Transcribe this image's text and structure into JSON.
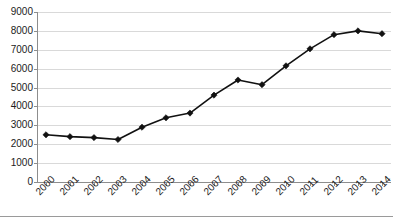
{
  "chart_data": {
    "type": "line",
    "title": "",
    "subtitle": "",
    "xlabel": "",
    "ylabel": "",
    "categories": [
      "2000",
      "2001",
      "2002",
      "2003",
      "2004",
      "2005",
      "2006",
      "2007",
      "2008",
      "2009",
      "2010",
      "2011",
      "2012",
      "2013",
      "2014"
    ],
    "values": [
      2500,
      2400,
      2350,
      2250,
      2900,
      3400,
      3650,
      4600,
      5400,
      5150,
      6150,
      7050,
      7800,
      8000,
      7850
    ],
    "series": [
      {
        "name": "series-1",
        "values": [
          2500,
          2400,
          2350,
          2250,
          2900,
          3400,
          3650,
          4600,
          5400,
          5150,
          6150,
          7050,
          7800,
          8000,
          7850
        ],
        "color": "#111111",
        "marker": "diamond"
      }
    ],
    "ylim": [
      0,
      9000
    ],
    "y_ticks": [
      0,
      1000,
      2000,
      3000,
      4000,
      5000,
      6000,
      7000,
      8000,
      9000
    ],
    "y_tick_labels": [
      "0",
      "1000",
      "2000",
      "3000",
      "4000",
      "5000",
      "6000",
      "7000",
      "8000",
      "9000"
    ],
    "x_tick_labels": [
      "2000",
      "2001",
      "2002",
      "2003",
      "2004",
      "2005",
      "2006",
      "2007",
      "2008",
      "2009",
      "2010",
      "2011",
      "2012",
      "2013",
      "2014"
    ],
    "x_tick_rotation": -45,
    "grid": {
      "horizontal": true,
      "vertical": false,
      "color": "#d9d9d9"
    },
    "legend": {
      "visible": false,
      "position": "none"
    },
    "annotations": [],
    "axis_color": "#8d8d8d",
    "background": "#ffffff"
  }
}
